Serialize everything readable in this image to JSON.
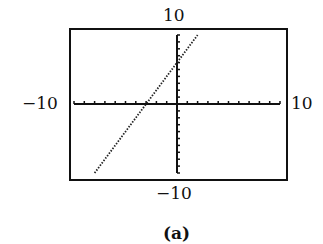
{
  "chart_data": {
    "type": "line",
    "title": "",
    "caption": "(a)",
    "xlabel": "",
    "ylabel": "",
    "xlim": [
      -10,
      10
    ],
    "ylim": [
      -10,
      10
    ],
    "x_tick_step": 1,
    "y_tick_step": 1,
    "grid": false,
    "window_labels": {
      "ymax": "10",
      "ymin": "−10",
      "xmin": "−10",
      "xmax": "10"
    },
    "series": [
      {
        "name": "y = 2x + 6",
        "style": "dotted",
        "x": [
          -8,
          -3,
          0,
          2
        ],
        "y": [
          -10,
          0,
          6,
          10
        ]
      }
    ]
  }
}
